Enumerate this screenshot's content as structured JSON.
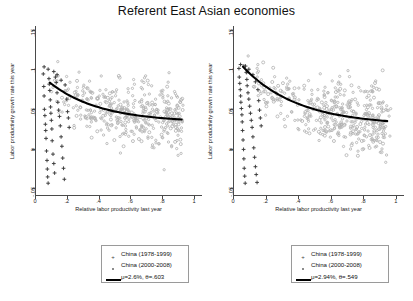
{
  "chart_data": {
    "type": "scatter",
    "title": "Referent East Asian economies",
    "xlabel": "Relative labor productivity last year",
    "ylabel": "Labor productivity growth rate this year",
    "xlim": [
      0,
      1.05
    ],
    "ylim": [
      -0.06,
      0.155
    ],
    "xticks": [
      "0",
      ".2",
      ".4",
      ".6",
      ".8",
      "1"
    ],
    "xtick_values": [
      0,
      0.2,
      0.4,
      0.6,
      0.8,
      1
    ],
    "yticks": [
      "-.05",
      "0",
      ".05",
      ".1",
      ".15"
    ],
    "ytick_values": [
      -0.05,
      0,
      0.05,
      0.1,
      0.15
    ],
    "grid": false,
    "legend_position": "below",
    "panels": [
      {
        "name": "left-panel",
        "fit_mu": "2.6%",
        "fit_theta": ".603",
        "fit_label": "μ=2.6%, θ=.603",
        "curve_start": [
          0.085,
          0.083
        ],
        "curve_end": [
          0.9,
          0.036
        ],
        "series": [
          {
            "name": "China (1978-1999)",
            "marker": "plus",
            "color": "#3a3a3a",
            "points": [
              [
                0.045,
                0.094
              ],
              [
                0.048,
                0.078
              ],
              [
                0.05,
                0.066
              ],
              [
                0.052,
                0.049
              ],
              [
                0.055,
                0.041
              ],
              [
                0.058,
                0.03
              ],
              [
                0.06,
                0.022
              ],
              [
                0.062,
                0.012
              ],
              [
                0.065,
                -0.004
              ],
              [
                0.068,
                -0.016
              ],
              [
                0.07,
                -0.027
              ],
              [
                0.072,
                -0.037
              ],
              [
                0.075,
                -0.045
              ],
              [
                0.08,
                0.088
              ],
              [
                0.082,
                0.081
              ],
              [
                0.085,
                0.073
              ],
              [
                0.088,
                0.061
              ],
              [
                0.09,
                0.052
              ],
              [
                0.092,
                0.044
              ],
              [
                0.095,
                0.035
              ],
              [
                0.098,
                0.024
              ],
              [
                0.1,
                0.009
              ],
              [
                0.105,
                -0.008
              ],
              [
                0.11,
                -0.02
              ],
              [
                0.115,
                -0.032
              ],
              [
                0.12,
                0.09
              ],
              [
                0.125,
                0.083
              ],
              [
                0.13,
                0.07
              ],
              [
                0.135,
                0.058
              ],
              [
                0.14,
                0.048
              ],
              [
                0.145,
                0.04
              ],
              [
                0.15,
                0.028
              ],
              [
                0.155,
                0.014
              ],
              [
                0.16,
                0.002
              ],
              [
                0.165,
                -0.013
              ],
              [
                0.17,
                -0.026
              ],
              [
                0.175,
                -0.04
              ],
              [
                0.05,
                0.103
              ],
              [
                0.075,
                0.1
              ],
              [
                0.11,
                0.097
              ],
              [
                0.13,
                0.093
              ],
              [
                0.155,
                0.086
              ],
              [
                0.18,
                0.08
              ],
              [
                0.19,
                0.062
              ],
              [
                0.195,
                0.046
              ],
              [
                0.2,
                0.038
              ],
              [
                0.205,
                0.026
              ]
            ]
          },
          {
            "name": "China (2000-2008)",
            "marker": "dot",
            "color": "#b4b4b4",
            "n_points": 420
          }
        ]
      },
      {
        "name": "right-panel",
        "fit_mu": "2.94%",
        "fit_theta": ".549",
        "fit_label": "μ=2.94%, θ=.549",
        "curve_start": [
          0.055,
          0.103
        ],
        "curve_end": [
          0.93,
          0.034
        ],
        "series": [
          {
            "name": "China (1978-1999)",
            "marker": "plus",
            "color": "#3a3a3a",
            "points": [
              [
                0.03,
                0.101
              ],
              [
                0.032,
                0.09
              ],
              [
                0.035,
                0.082
              ],
              [
                0.038,
                0.074
              ],
              [
                0.04,
                0.066
              ],
              [
                0.042,
                0.058
              ],
              [
                0.045,
                0.05
              ],
              [
                0.048,
                0.042
              ],
              [
                0.05,
                0.033
              ],
              [
                0.052,
                0.022
              ],
              [
                0.055,
                0.01
              ],
              [
                0.058,
                -0.002
              ],
              [
                0.06,
                -0.014
              ],
              [
                0.062,
                -0.026
              ],
              [
                0.065,
                -0.036
              ],
              [
                0.068,
                -0.045
              ],
              [
                0.07,
                0.104
              ],
              [
                0.075,
                0.096
              ],
              [
                0.078,
                0.087
              ],
              [
                0.08,
                0.079
              ],
              [
                0.085,
                0.07
              ],
              [
                0.09,
                0.062
              ],
              [
                0.095,
                0.053
              ],
              [
                0.1,
                0.044
              ],
              [
                0.105,
                0.035
              ],
              [
                0.11,
                0.026
              ],
              [
                0.115,
                0.014
              ],
              [
                0.12,
                0.0
              ],
              [
                0.125,
                -0.012
              ],
              [
                0.13,
                -0.024
              ],
              [
                0.135,
                -0.034
              ],
              [
                0.14,
                -0.044
              ],
              [
                0.04,
                0.106
              ],
              [
                0.06,
                0.104
              ],
              [
                0.09,
                0.1
              ],
              [
                0.115,
                0.093
              ],
              [
                0.13,
                0.084
              ],
              [
                0.145,
                0.074
              ],
              [
                0.15,
                0.06
              ],
              [
                0.155,
                0.048
              ],
              [
                0.16,
                0.038
              ],
              [
                0.165,
                0.028
              ]
            ]
          },
          {
            "name": "China (2000-2008)",
            "marker": "dot",
            "color": "#b4b4b4",
            "n_points": 440
          }
        ]
      }
    ]
  },
  "legends": [
    {
      "name": "left-legend",
      "rows": [
        {
          "marker": "plus-marker",
          "label": "China (1978-1999)"
        },
        {
          "marker": "dot-marker",
          "label": "China (2000-2008)"
        },
        {
          "marker": "line-marker",
          "label": "μ=2.6%, θ=.603"
        }
      ]
    },
    {
      "name": "right-legend",
      "rows": [
        {
          "marker": "plus-marker",
          "label": "China (1978-1999)"
        },
        {
          "marker": "dot-marker",
          "label": "China (2000-2008)"
        },
        {
          "marker": "line-marker",
          "label": "μ=2.94%, θ=.549"
        }
      ]
    }
  ],
  "colors": {
    "axis": "#4a4a4a",
    "early_period": "#3a3a3a",
    "late_period": "#b4b4b4",
    "fit_curve": "#000000",
    "background": "#ffffff"
  }
}
